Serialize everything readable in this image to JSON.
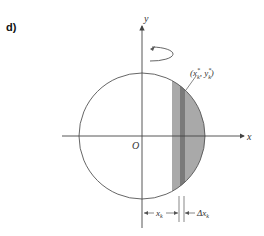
{
  "figure": {
    "panel_label": "d)",
    "axes": {
      "x_label": "x",
      "y_label": "y",
      "origin_label": "O"
    },
    "point_label": {
      "base": "(x",
      "sup1": "*",
      "sub1": "k",
      "mid": ", y",
      "sup2": "*",
      "sub2": "k",
      "end": ")"
    },
    "dimensions": {
      "xk_label": "x",
      "xk_sub": "k",
      "dxk_label": "Δx",
      "dxk_sub": "k"
    },
    "colors": {
      "line": "#555555",
      "strip_light": "#a9a9a9",
      "strip_dark": "#7a7a7a",
      "text": "#333333"
    },
    "rotation_indicator": "rotation-about-y-axis"
  }
}
